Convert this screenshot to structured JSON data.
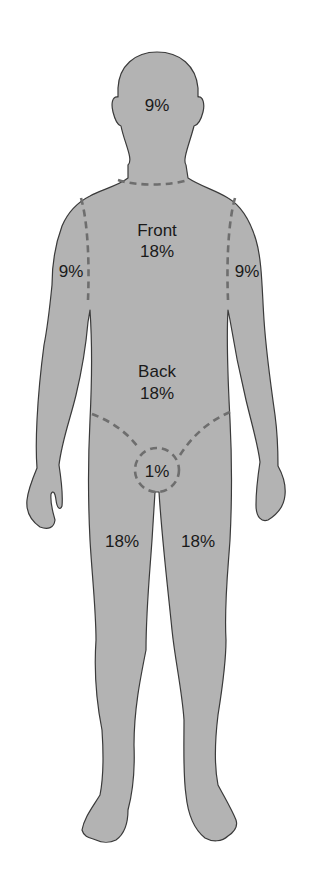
{
  "diagram": {
    "title": "",
    "type": "body-surface-area-rule-of-nines",
    "fill_color": "#b3b3b3",
    "outline_color": "#3a3a3a",
    "dash_color": "#6e6e6e",
    "regions": {
      "head": {
        "label": "9%"
      },
      "trunk_front": {
        "name": "Front",
        "label": "18%"
      },
      "trunk_back": {
        "name": "Back",
        "label": "18%"
      },
      "left_arm": {
        "label": "9%"
      },
      "right_arm": {
        "label": "9%"
      },
      "perineum": {
        "label": "1%"
      },
      "left_leg": {
        "label": "18%"
      },
      "right_leg": {
        "label": "18%"
      }
    }
  }
}
